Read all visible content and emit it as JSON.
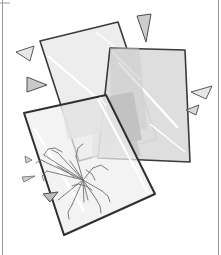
{
  "canvas": {
    "width": 221,
    "height": 255,
    "background": "#ffffff",
    "title": "Broken glass panes illustration"
  },
  "frame": {
    "name": "page-border",
    "left_rule_x": 2.5,
    "right_rule_x": 218.5,
    "top_rule": {
      "x1": 0,
      "x2": 10,
      "y": 3
    },
    "stroke": "#9a9a9a",
    "stroke_width": 1
  },
  "palette": {
    "glass_light": "#ededed",
    "glass_mid": "#e2e2e2",
    "glass_dark": "#c9c9c9",
    "glass_darker": "#bfbfbf",
    "outline": "#3a3a3a",
    "shard_fill": "#cfcfcf",
    "shard_fill_light": "#e6e6e6",
    "shard_outline": "#5a5a5a",
    "crack": "#6f6f6f",
    "highlight": "#ffffff"
  },
  "panels": [
    {
      "id": "panel-back-left",
      "label": "Back left glass pane",
      "points": "40,41 118,22 157,139 79,161",
      "fill": "#ededed",
      "opacity": 1,
      "outline": "#3a3a3a",
      "stroke_width": 1.6,
      "highlights": [
        {
          "x1": 48,
          "y1": 56,
          "x2": 132,
          "y2": 128,
          "width": 2.2
        },
        {
          "x1": 96,
          "y1": 32,
          "x2": 150,
          "y2": 76,
          "width": 1.4
        }
      ]
    },
    {
      "id": "panel-back-right",
      "label": "Back right glass pane",
      "points": "110,48 185,50 190,162 98,158",
      "fill": "#dcdcdc",
      "opacity": 1,
      "outline": "#3a3a3a",
      "stroke_width": 1.6,
      "highlights": [
        {
          "x1": 118,
          "y1": 62,
          "x2": 178,
          "y2": 128,
          "width": 2.4
        },
        {
          "x1": 112,
          "y1": 52,
          "x2": 141,
          "y2": 80,
          "width": 1.3
        },
        {
          "x1": 150,
          "y1": 124,
          "x2": 185,
          "y2": 152,
          "width": 1.6
        }
      ]
    },
    {
      "id": "panel-front",
      "label": "Front cracked glass pane",
      "points": "24,113 106,95 155,194 64,235",
      "fill": "#efefef",
      "opacity": 1,
      "outline": "#2f2f2f",
      "stroke_width": 2,
      "highlights": [
        {
          "x1": 34,
          "y1": 128,
          "x2": 84,
          "y2": 211,
          "width": 2.6
        },
        {
          "x1": 98,
          "y1": 99,
          "x2": 148,
          "y2": 193,
          "width": 2.2
        },
        {
          "x1": 100,
          "y1": 97,
          "x2": 106,
          "y2": 106,
          "width": 1.2
        }
      ]
    }
  ],
  "overlap_shades": [
    {
      "id": "overlap-a",
      "points": "61,104 106,95 118,128 68,140",
      "fill": "#c6c6c6",
      "opacity": 0.85
    },
    {
      "id": "overlap-b",
      "points": "110,96 133,92 142,140 104,146",
      "fill": "#bdbdbd",
      "opacity": 0.8
    },
    {
      "id": "overlap-c",
      "points": "93,126 131,120 141,156 92,158",
      "fill": "#c2c2c2",
      "opacity": 0.7
    },
    {
      "id": "overlap-d",
      "points": "110,48 139,47 147,129 112,132",
      "fill": "#cccccc",
      "opacity": 0.55
    }
  ],
  "crack": {
    "id": "crack-web",
    "label": "Spiderweb crack pattern",
    "center": {
      "x": 83,
      "y": 180
    },
    "stroke": "#6f6f6f",
    "stroke_width": 0.9,
    "radials": [
      "83,180 44,155",
      "83,180 41,160",
      "83,180 47,171",
      "83,180 63,196",
      "83,180 72,205",
      "83,180 84,202",
      "83,180 88,200",
      "83,180 96,199",
      "83,180 102,191",
      "83,180 93,168",
      "83,180 76,156",
      "83,180 70,161",
      "83,180 58,153"
    ],
    "branches": [
      "44,155 48,149 55,148 62,152",
      "76,156 78,148 83,144",
      "93,168 101,165 108,170",
      "102,191 108,196 110,202",
      "96,199 100,206 101,213",
      "72,205 68,212 69,219",
      "41,160 36,163",
      "47,171 42,176 44,181",
      "63,196 58,200",
      "58,153 52,150"
    ],
    "webs": [
      "57,166 68,172 75,178",
      "72,186 78,184 86,186 92,190",
      "86,170 92,174 95,180"
    ]
  },
  "shards": [
    {
      "id": "shard-tl-1",
      "points": "16,52 34,46 30,61",
      "fill": "#e6e6e6",
      "outline": "#5a5a5a"
    },
    {
      "id": "shard-tl-2",
      "points": "27,77 47,85 27,92",
      "fill": "#c9c9c9",
      "outline": "#4d4d4d"
    },
    {
      "id": "shard-top-1",
      "points": "137,16 151,14 146,42",
      "fill": "#cccccc",
      "outline": "#4d4d4d"
    },
    {
      "id": "shard-right-1",
      "points": "212,86 191,92 206,99",
      "fill": "#e6e6e6",
      "outline": "#5a5a5a"
    },
    {
      "id": "shard-right-2",
      "points": "199,105 186,110 196,115",
      "fill": "#d8d8d8",
      "outline": "#5a5a5a"
    },
    {
      "id": "shard-left-sm-1",
      "points": "25,156 32,160 26,163",
      "fill": "#cfcfcf",
      "outline": "#6a6a6a"
    },
    {
      "id": "shard-left-sm-2",
      "points": "22,177 35,176 24,182",
      "fill": "#cfcfcf",
      "outline": "#6a6a6a"
    },
    {
      "id": "shard-left-sm-3",
      "points": "43,194 58,192 50,202",
      "fill": "#bdbdbd",
      "outline": "#4d4d4d"
    }
  ],
  "meta": {
    "interactable_elements": 0,
    "text_elements": 0
  }
}
